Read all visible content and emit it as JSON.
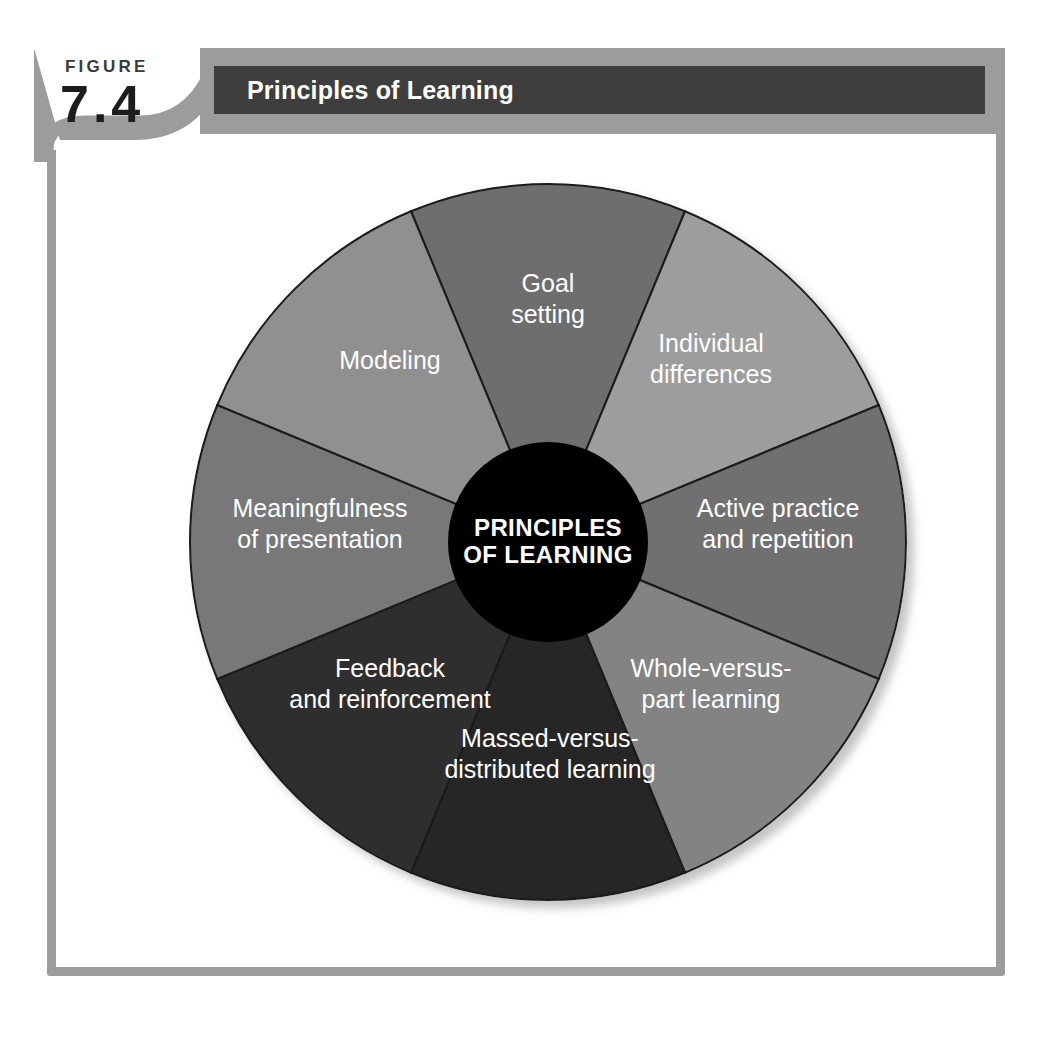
{
  "figure": {
    "label_word": "FIGURE",
    "number": "7.4"
  },
  "header": {
    "title": "Principles of Learning"
  },
  "hub": {
    "line1": "PRINCIPLES",
    "line2": "OF LEARNING"
  },
  "colors": {
    "frame": "#9c9c9c",
    "title_band_gray": "#9c9c9c",
    "title_band_dark": "#3e3e3e",
    "title_text": "#ffffff",
    "hub_fill": "#000000",
    "hub_text": "#ffffff",
    "segment_stroke": "#1a1a1a",
    "page_background": "#ffffff"
  },
  "chart_data": {
    "type": "pie",
    "title": "Principles of Learning",
    "center_label": "PRINCIPLES OF LEARNING",
    "equal_slices": true,
    "slice_count": 8,
    "slice_degrees": 45,
    "start_angle_deg": -22.5,
    "direction": "clockwise",
    "outer_radius": 358,
    "inner_radius": 100,
    "legend_position": "none",
    "grid": false,
    "categories": [
      "Goal setting",
      "Individual differences",
      "Active practice and repetition",
      "Whole-versus-part learning",
      "Massed-versus-distributed learning",
      "Feedback and reinforcement",
      "Meaningfulness of presentation",
      "Modeling"
    ],
    "values": [
      12.5,
      12.5,
      12.5,
      12.5,
      12.5,
      12.5,
      12.5,
      12.5
    ],
    "slices": [
      {
        "index": 0,
        "lines": [
          "Goal",
          "setting"
        ],
        "label": "Goal setting",
        "value": 12.5,
        "start_deg": -22.5,
        "end_deg": 22.5,
        "mid_deg": 0,
        "color": "#6e6e6e",
        "label_x": 380,
        "label_y": 145
      },
      {
        "index": 1,
        "lines": [
          "Individual",
          "differences"
        ],
        "label": "Individual differences",
        "value": 12.5,
        "start_deg": 22.5,
        "end_deg": 67.5,
        "mid_deg": 45,
        "color": "#9d9d9d",
        "label_x": 543,
        "label_y": 205
      },
      {
        "index": 2,
        "lines": [
          "Active practice",
          "and repetition"
        ],
        "label": "Active practice and repetition",
        "value": 12.5,
        "start_deg": 67.5,
        "end_deg": 112.5,
        "mid_deg": 90,
        "color": "#6f6f6f",
        "label_x": 610,
        "label_y": 370
      },
      {
        "index": 3,
        "lines": [
          "Whole-versus-",
          "part learning"
        ],
        "label": "Whole-versus-part learning",
        "value": 12.5,
        "start_deg": 112.5,
        "end_deg": 157.5,
        "mid_deg": 135,
        "color": "#838383",
        "label_x": 543,
        "label_y": 530
      },
      {
        "index": 4,
        "lines": [
          "Massed-versus-",
          "distributed learning"
        ],
        "label": "Massed-versus-distributed learning",
        "value": 12.5,
        "start_deg": 157.5,
        "end_deg": 202.5,
        "mid_deg": 180,
        "color": "#262626",
        "label_x": 382,
        "label_y": 600
      },
      {
        "index": 5,
        "lines": [
          "Feedback",
          "and reinforcement"
        ],
        "label": "Feedback and reinforcement",
        "value": 12.5,
        "start_deg": 202.5,
        "end_deg": 247.5,
        "mid_deg": 225,
        "color": "#2f2f2f",
        "label_x": 222,
        "label_y": 530
      },
      {
        "index": 6,
        "lines": [
          "Meaningfulness",
          "of presentation"
        ],
        "label": "Meaningfulness of presentation",
        "value": 12.5,
        "start_deg": 247.5,
        "end_deg": 292.5,
        "mid_deg": 270,
        "color": "#787878",
        "label_x": 152,
        "label_y": 370
      },
      {
        "index": 7,
        "lines": [
          "Modeling"
        ],
        "label": "Modeling",
        "value": 12.5,
        "start_deg": 292.5,
        "end_deg": 337.5,
        "mid_deg": 315,
        "color": "#909090",
        "label_x": 222,
        "label_y": 207
      }
    ]
  }
}
